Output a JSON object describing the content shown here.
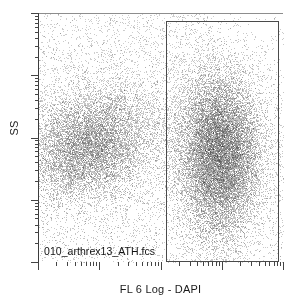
{
  "plot": {
    "title": "",
    "file_label": "010_arthrex13_ATH.fcs",
    "x_axis_label": "FL 6 Log - DAPI",
    "y_axis_label": "SS",
    "background_color": "#ffffff",
    "frame_color": "#3b3b3b",
    "gate_color": "#4a4a4a",
    "point_color": "#2b2b2b"
  },
  "chart_data": {
    "type": "scatter",
    "title": "",
    "xlabel": "FL 6 Log - DAPI",
    "ylabel": "SS",
    "x_scale": "log",
    "y_scale": "log",
    "x_decades": 4,
    "y_decades": 4,
    "xlim": [
      1,
      10000
    ],
    "ylim": [
      1,
      10000
    ],
    "grid": false,
    "legend": "none",
    "annotations": [
      {
        "text": "010_arthrex13_ATH.fcs",
        "x_frac": 0.03,
        "y_frac": 0.93
      }
    ],
    "gates": [
      {
        "name": "DAPI-positive gate",
        "type": "rectangle",
        "x_frac": [
          0.523,
          0.984
        ],
        "y_frac": [
          0.032,
          1.0
        ]
      }
    ],
    "populations": [
      {
        "name": "DAPI-negative / low SS diagonal cluster",
        "center_x_frac": 0.205,
        "center_y_frac": 0.475,
        "spread_x_frac": 0.135,
        "spread_y_frac": 0.105,
        "rotation_deg": -28,
        "n_points": 9000,
        "peak_density": "high",
        "core_shade": "#6f6f6f"
      },
      {
        "name": "DAPI-positive main population",
        "center_x_frac": 0.735,
        "center_y_frac": 0.44,
        "spread_x_frac": 0.085,
        "spread_y_frac": 0.165,
        "rotation_deg": 0,
        "n_points": 16000,
        "peak_density": "saturated",
        "core_shade": "#f0f0f0"
      },
      {
        "name": "Sparse debris / background scatter",
        "center_x_frac": 0.45,
        "center_y_frac": 0.35,
        "spread_x_frac": 0.38,
        "spread_y_frac": 0.32,
        "rotation_deg": 0,
        "n_points": 5200,
        "peak_density": "low",
        "core_shade": "#9a9a9a"
      }
    ]
  }
}
